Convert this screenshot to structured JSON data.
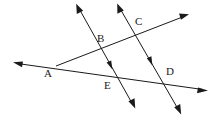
{
  "figure": {
    "width": 214,
    "height": 121,
    "background_color": "#ffffff",
    "stroke_color": "#1a1a1a",
    "label_color": "#1a1a1a"
  },
  "points": [
    {
      "id": "A",
      "label": "A",
      "label_x": 44,
      "label_y": 68,
      "x": 56,
      "y": 66,
      "role": "vertex-of-two-lines"
    },
    {
      "id": "B",
      "label": "B",
      "label_x": 97,
      "label_y": 33,
      "x": 101,
      "y": 48,
      "role": "intersection"
    },
    {
      "id": "C",
      "label": "C",
      "label_x": 135,
      "label_y": 16,
      "x": 136,
      "y": 30,
      "role": "intersection"
    },
    {
      "id": "D",
      "label": "D",
      "label_x": 166,
      "label_y": 66,
      "x": 166,
      "y": 81,
      "role": "intersection"
    },
    {
      "id": "E",
      "label": "E",
      "label_x": 104,
      "label_y": 80,
      "x": 111,
      "y": 77,
      "role": "intersection"
    }
  ],
  "lines": [
    {
      "id": "line-ABC",
      "name": "ray-through-A-B-C",
      "from_x": 56,
      "from_y": 66,
      "to_x": 188,
      "to_y": 15,
      "arrow_at_end": true,
      "arrow_at_start": false,
      "passes_through": [
        "A",
        "B",
        "C"
      ]
    },
    {
      "id": "line-AED",
      "name": "line-through-A-E-D",
      "from_x": 14,
      "from_y": 63,
      "to_x": 207,
      "to_y": 90,
      "arrow_at_end": true,
      "arrow_at_start": true,
      "passes_through": [
        "A",
        "E",
        "D"
      ]
    },
    {
      "id": "line-BE",
      "name": "transversal-through-B-and-E",
      "from_x": 77,
      "from_y": 5,
      "to_x": 134,
      "to_y": 107,
      "arrow_at_end": true,
      "arrow_at_start": true,
      "passes_through": [
        "B",
        "E"
      ],
      "direction_tick_x": 110,
      "direction_tick_y": 65
    },
    {
      "id": "line-CD",
      "name": "transversal-through-C-and-D",
      "from_x": 118,
      "from_y": 5,
      "to_x": 180,
      "to_y": 113,
      "arrow_at_end": true,
      "arrow_at_start": true,
      "passes_through": [
        "C",
        "D"
      ],
      "direction_tick_x": 150,
      "direction_tick_y": 61
    }
  ]
}
